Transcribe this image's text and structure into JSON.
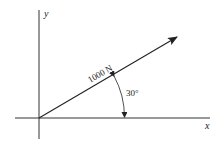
{
  "diagram": {
    "type": "force-vector",
    "axes": {
      "x_label": "x",
      "y_label": "y"
    },
    "force": {
      "magnitude_label": "1000 N",
      "magnitude": 1000,
      "unit": "N",
      "angle_deg": 30,
      "angle_reference": "x-axis"
    },
    "angle_label": "30°",
    "colors": {
      "line": "#222222",
      "background": "#ffffff"
    }
  }
}
